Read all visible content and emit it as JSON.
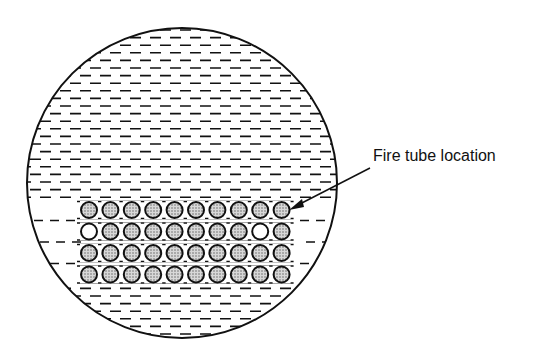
{
  "figure": {
    "annotation": {
      "label": "Fire tube location",
      "arrow_target": "top-right tube"
    },
    "shell": {
      "shape": "circle",
      "fill_pattern": "horizontal dashes (water)"
    },
    "tube_bank": {
      "rows": 4,
      "columns": 10,
      "empty_positions": [
        [
          2,
          1
        ],
        [
          2,
          9
        ]
      ],
      "filled_pattern": "stippled"
    }
  },
  "colors": {
    "stroke": "#111111",
    "background": "#ffffff",
    "stipple": "#888888"
  }
}
